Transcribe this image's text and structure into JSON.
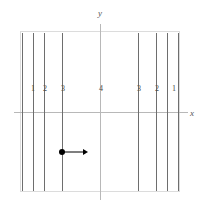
{
  "figure": {
    "title": "",
    "width": 204,
    "height": 208,
    "background_color": "#ffffff"
  },
  "frame": {
    "left": 20,
    "top": 31,
    "width": 160,
    "height": 161,
    "border_color": "#dcdcdc"
  },
  "axes": {
    "y_axis": {
      "label": "y",
      "x": 100,
      "top": 24,
      "bottom": 200,
      "color": "#b8b8b8"
    },
    "x_axis": {
      "label": "x",
      "y": 112,
      "left": 14,
      "right": 188,
      "color": "#b8b8b8"
    },
    "y_label_position": {
      "x": 100,
      "y": 13
    },
    "x_label_position": {
      "x": 192,
      "y": 113
    }
  },
  "field_lines": {
    "color": "#6e6e6e",
    "top": 33,
    "bottom": 191,
    "x_positions": [
      22,
      33,
      44,
      62,
      138,
      156,
      167,
      178
    ]
  },
  "tick_labels": {
    "color": "#4a4a4a",
    "y": 89,
    "items": [
      {
        "text": "1",
        "x": 33
      },
      {
        "text": "2",
        "x": 45
      },
      {
        "text": "3",
        "x": 63
      },
      {
        "text": "4",
        "x": 101
      },
      {
        "text": "3",
        "x": 139
      },
      {
        "text": "2",
        "x": 157
      },
      {
        "text": "1",
        "x": 174
      }
    ]
  },
  "particle": {
    "dot": {
      "x": 62,
      "y": 152,
      "diameter": 6,
      "color": "#000000"
    },
    "velocity_vector": {
      "start_x": 62,
      "end_x": 88,
      "y": 152,
      "color": "#000000",
      "direction": "right"
    }
  }
}
